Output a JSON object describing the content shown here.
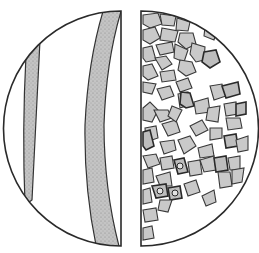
{
  "figure": {
    "description": "Split circle comparing fibrous strands (left) and granular particles (right)",
    "left_panel": {
      "subject": "fibers",
      "fiber_count": 2
    },
    "right_panel": {
      "subject": "particles"
    },
    "colors": {
      "outline": "#2a2a2a",
      "fill_gray": "#c9c9c9",
      "background": "#ffffff"
    }
  }
}
